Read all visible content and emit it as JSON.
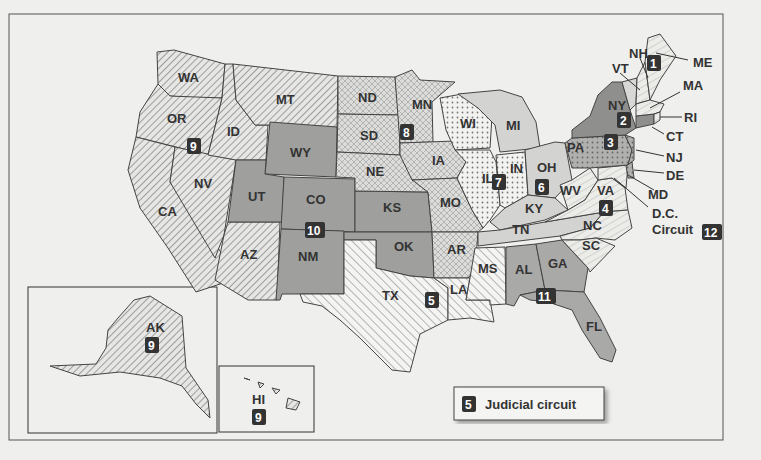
{
  "map": {
    "title": "U.S. Federal Judicial Circuits",
    "legend": {
      "badge": "5",
      "label": "Judicial circuit"
    },
    "states": [
      {
        "abbr": "WA",
        "circuit": "9"
      },
      {
        "abbr": "OR",
        "circuit": "9"
      },
      {
        "abbr": "CA",
        "circuit": "9"
      },
      {
        "abbr": "ID",
        "circuit": "9"
      },
      {
        "abbr": "NV",
        "circuit": "9"
      },
      {
        "abbr": "MT",
        "circuit": "9"
      },
      {
        "abbr": "AZ",
        "circuit": "9"
      },
      {
        "abbr": "AK",
        "circuit": "9"
      },
      {
        "abbr": "HI",
        "circuit": "9"
      },
      {
        "abbr": "WY",
        "circuit": "10"
      },
      {
        "abbr": "UT",
        "circuit": "10"
      },
      {
        "abbr": "CO",
        "circuit": "10"
      },
      {
        "abbr": "KS",
        "circuit": "10"
      },
      {
        "abbr": "NM",
        "circuit": "10"
      },
      {
        "abbr": "OK",
        "circuit": "10"
      },
      {
        "abbr": "ND",
        "circuit": "8"
      },
      {
        "abbr": "SD",
        "circuit": "8"
      },
      {
        "abbr": "NE",
        "circuit": "8"
      },
      {
        "abbr": "MN",
        "circuit": "8"
      },
      {
        "abbr": "IA",
        "circuit": "8"
      },
      {
        "abbr": "MO",
        "circuit": "8"
      },
      {
        "abbr": "AR",
        "circuit": "8"
      },
      {
        "abbr": "TX",
        "circuit": "5"
      },
      {
        "abbr": "LA",
        "circuit": "5"
      },
      {
        "abbr": "MS",
        "circuit": "5"
      },
      {
        "abbr": "WI",
        "circuit": "7"
      },
      {
        "abbr": "IL",
        "circuit": "7"
      },
      {
        "abbr": "IN",
        "circuit": "7"
      },
      {
        "abbr": "MI",
        "circuit": "6"
      },
      {
        "abbr": "OH",
        "circuit": "6"
      },
      {
        "abbr": "KY",
        "circuit": "6"
      },
      {
        "abbr": "TN",
        "circuit": "6"
      },
      {
        "abbr": "AL",
        "circuit": "11"
      },
      {
        "abbr": "GA",
        "circuit": "11"
      },
      {
        "abbr": "FL",
        "circuit": "11"
      },
      {
        "abbr": "WV",
        "circuit": "4"
      },
      {
        "abbr": "VA",
        "circuit": "4"
      },
      {
        "abbr": "NC",
        "circuit": "4"
      },
      {
        "abbr": "SC",
        "circuit": "4"
      },
      {
        "abbr": "MD",
        "circuit": "4"
      },
      {
        "abbr": "PA",
        "circuit": "3"
      },
      {
        "abbr": "NJ",
        "circuit": "3"
      },
      {
        "abbr": "DE",
        "circuit": "3"
      },
      {
        "abbr": "NY",
        "circuit": "2"
      },
      {
        "abbr": "VT",
        "circuit": "2"
      },
      {
        "abbr": "CT",
        "circuit": "2"
      },
      {
        "abbr": "ME",
        "circuit": "1"
      },
      {
        "abbr": "NH",
        "circuit": "1"
      },
      {
        "abbr": "MA",
        "circuit": "1"
      },
      {
        "abbr": "RI",
        "circuit": "1"
      }
    ],
    "labels": {
      "WA": "WA",
      "OR": "OR",
      "CA": "CA",
      "ID": "ID",
      "NV": "NV",
      "MT": "MT",
      "AZ": "AZ",
      "WY": "WY",
      "UT": "UT",
      "CO": "CO",
      "NM": "NM",
      "ND": "ND",
      "SD": "SD",
      "NE": "NE",
      "KS": "KS",
      "OK": "OK",
      "TX": "TX",
      "MN": "MN",
      "IA": "IA",
      "MO": "MO",
      "AR": "AR",
      "LA": "LA",
      "WI": "WI",
      "IL": "IL",
      "MI": "MI",
      "IN": "IN",
      "OH": "OH",
      "KY": "KY",
      "TN": "TN",
      "MS": "MS",
      "AL": "AL",
      "GA": "GA",
      "FL": "FL",
      "SC": "SC",
      "NC": "NC",
      "VA": "VA",
      "WV": "WV",
      "PA": "PA",
      "NY": "NY",
      "VT": "VT",
      "NH": "NH",
      "ME": "ME",
      "MA": "MA",
      "RI": "RI",
      "CT": "CT",
      "NJ": "NJ",
      "DE": "DE",
      "MD": "MD",
      "DC1": "D.C.",
      "DC2": "Circuit",
      "AK": "AK",
      "HI": "HI"
    },
    "badges": {
      "c1": "1",
      "c2": "2",
      "c3": "3",
      "c4": "4",
      "c5": "5",
      "c6": "6",
      "c7": "7",
      "c8": "8",
      "c9": "9",
      "c9ak": "9",
      "c9hi": "9",
      "c10": "10",
      "c11": "11",
      "c12": "12"
    }
  }
}
